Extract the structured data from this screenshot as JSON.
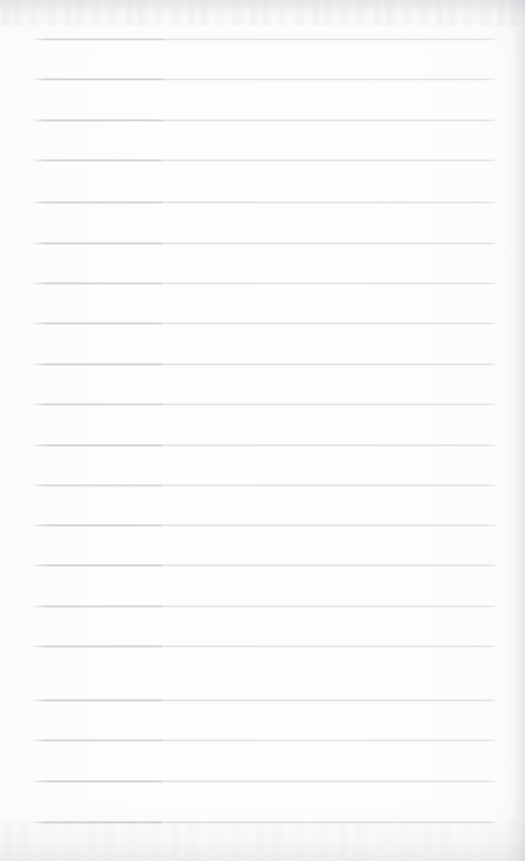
{
  "document": {
    "kind": "scanned-lined-notebook-page",
    "description": "Blank ruled notebook page, scanned. No handwriting, no printed text.",
    "content_text": "",
    "page_width": 525,
    "page_height": 861,
    "background_color": "#fdfdfd",
    "paper_tone": "#fefefe"
  },
  "ruling": {
    "line_count": 20,
    "line_color_left_segment": "#babbc1",
    "line_color_right_segment": "#c9cad0",
    "line_thickness_px": 1,
    "line_start_x": 31,
    "line_end_x": 501,
    "seam_x": 162,
    "first_line_y": 39,
    "line_spacing_px": 41.2,
    "lines": [
      {
        "index": 1,
        "y": 39
      },
      {
        "index": 2,
        "y": 79
      },
      {
        "index": 3,
        "y": 120
      },
      {
        "index": 4,
        "y": 160
      },
      {
        "index": 5,
        "y": 202
      },
      {
        "index": 6,
        "y": 243
      },
      {
        "index": 7,
        "y": 283
      },
      {
        "index": 8,
        "y": 323
      },
      {
        "index": 9,
        "y": 364
      },
      {
        "index": 10,
        "y": 404
      },
      {
        "index": 11,
        "y": 445
      },
      {
        "index": 12,
        "y": 485
      },
      {
        "index": 13,
        "y": 525
      },
      {
        "index": 14,
        "y": 565
      },
      {
        "index": 15,
        "y": 606
      },
      {
        "index": 16,
        "y": 646
      },
      {
        "index": 17,
        "y": 700
      },
      {
        "index": 18,
        "y": 740
      },
      {
        "index": 19,
        "y": 781
      },
      {
        "index": 20,
        "y": 822
      }
    ]
  },
  "scan_artifacts": {
    "top_noise_band_height": 26,
    "bottom_noise_band_height": 40,
    "right_edge_shading_width": 16,
    "seam_note": "slight tonal step in every rule near x=162"
  }
}
